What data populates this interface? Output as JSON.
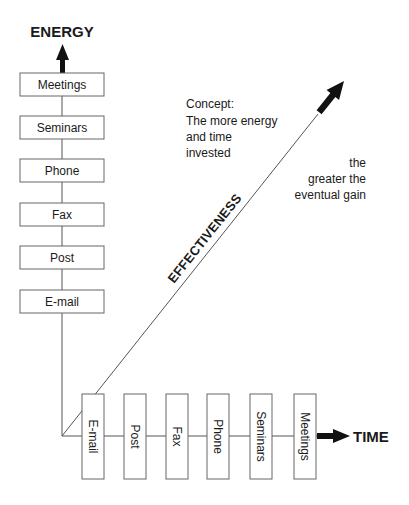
{
  "diagram": {
    "y_axis": {
      "label": "ENERGY"
    },
    "x_axis": {
      "label": "TIME"
    },
    "diagonal": {
      "label": "EFFECTIVENESS"
    },
    "vertical_boxes": [
      {
        "label": "Meetings"
      },
      {
        "label": "Seminars"
      },
      {
        "label": "Phone"
      },
      {
        "label": "Fax"
      },
      {
        "label": "Post"
      },
      {
        "label": "E-mail"
      }
    ],
    "horizontal_boxes": [
      {
        "label": "E-mail"
      },
      {
        "label": "Post"
      },
      {
        "label": "Fax"
      },
      {
        "label": "Phone"
      },
      {
        "label": "Seminars"
      },
      {
        "label": "Meetings"
      }
    ],
    "concept": {
      "heading": "Concept:",
      "lines": [
        "The more energy",
        "and time",
        "invested"
      ]
    },
    "conclusion": {
      "lines": [
        "the",
        "greater the",
        "eventual gain"
      ]
    },
    "colors": {
      "line": "#555555",
      "arrow": "#111111",
      "box_border": "#666666",
      "text": "#1a1a1a"
    }
  }
}
